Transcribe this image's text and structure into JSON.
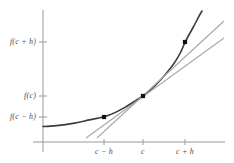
{
  "figure": {
    "kind": "calculus-derivative-diagram",
    "background_color": "#ffffff"
  },
  "chart_data": {
    "type": "line",
    "title": "",
    "subtitle": "",
    "xlabel": "",
    "ylabel": "",
    "grid": false,
    "legend": null,
    "axis_color": "#9a9a9a",
    "xlim": [
      0,
      10
    ],
    "ylim": [
      0,
      10
    ],
    "axes": {
      "y_axis_x_px": 43,
      "x_axis_y_px": 142,
      "y_axis_top_px": 10,
      "y_axis_bottom_px": 152,
      "x_axis_left_px": 33,
      "x_axis_right_px": 225
    },
    "y_ticks": [
      {
        "label": "f(c + h)",
        "y_px": 42
      },
      {
        "label": "f(c)",
        "y_px": 96
      },
      {
        "label": "f(c − h)",
        "y_px": 117
      }
    ],
    "x_ticks": [
      {
        "label": "c − h",
        "x_px": 104
      },
      {
        "label": "c",
        "x_px": 143
      },
      {
        "label": "c + h",
        "x_px": 185
      }
    ],
    "series": [
      {
        "name": "curve",
        "role": "function-curve",
        "color": "#3c3c3c",
        "width": 1.6,
        "points_px": [
          [
            43,
            126.5
          ],
          [
            52,
            126.0
          ],
          [
            61,
            125.2
          ],
          [
            70,
            124.0
          ],
          [
            79,
            122.3
          ],
          [
            88,
            120.2
          ],
          [
            96,
            118.6
          ],
          [
            104,
            117.0
          ],
          [
            112,
            114.0
          ],
          [
            120,
            110.2
          ],
          [
            128,
            105.6
          ],
          [
            136,
            100.4
          ],
          [
            143,
            96.0
          ],
          [
            151,
            89.6
          ],
          [
            159,
            81.8
          ],
          [
            167,
            72.8
          ],
          [
            175,
            62.4
          ],
          [
            181,
            52.0
          ],
          [
            185,
            42.0
          ],
          [
            190,
            33.0
          ],
          [
            195,
            24.0
          ],
          [
            199,
            16.0
          ],
          [
            202,
            11.0
          ]
        ]
      },
      {
        "name": "tangent-line",
        "role": "tangent-at-c",
        "color": "#a8a8a8",
        "width": 1.1,
        "from_px": [
          97,
          138
        ],
        "to_px": [
          224,
          21
        ]
      },
      {
        "name": "secant-line",
        "role": "secant-through-c-minus-h-and-c-plus-h",
        "color": "#a8a8a8",
        "width": 1.1,
        "from_px": [
          86,
          138
        ],
        "to_px": [
          224,
          38
        ]
      }
    ],
    "markers": [
      {
        "name": "point-c-minus-h",
        "x_px": 104,
        "y_px": 117,
        "size_px": 4.2,
        "color": "#111111"
      },
      {
        "name": "point-c",
        "x_px": 143,
        "y_px": 96,
        "size_px": 4.2,
        "color": "#111111"
      },
      {
        "name": "point-c-plus-h",
        "x_px": 185,
        "y_px": 42,
        "size_px": 4.2,
        "color": "#111111"
      }
    ]
  }
}
